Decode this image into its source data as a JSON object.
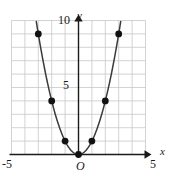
{
  "figure": {
    "name": "coordinate-plane-parabola",
    "width": 172,
    "height": 181
  },
  "labels": {
    "y_max": "10",
    "y_mid": "5",
    "y_axis_name": "y",
    "x_min": "-5",
    "x_max": "5",
    "x_axis_name": "x",
    "origin": "O"
  },
  "colors": {
    "grid": "#c9c6c9",
    "axis": "#1b1b1b",
    "curve": "#3a3a3a",
    "point": "#111111",
    "background": "#ffffff"
  },
  "chart_data": {
    "type": "scatter",
    "title": "",
    "xlabel": "x",
    "ylabel": "y",
    "xlim": [
      -5,
      5
    ],
    "ylim": [
      0,
      10
    ],
    "xticks": [
      -5,
      5
    ],
    "yticks": [
      5,
      10
    ],
    "grid": true,
    "grid_step": 1,
    "legend": "none",
    "curve": {
      "name": "y = x^2",
      "equation": "y = x^2",
      "style": "solid"
    },
    "x": [
      -3,
      -2,
      -1,
      0,
      1,
      2,
      3
    ],
    "values": [
      9,
      4,
      1,
      0,
      1,
      4,
      9
    ],
    "points": [
      {
        "x": -3,
        "y": 9
      },
      {
        "x": -2,
        "y": 4
      },
      {
        "x": -1,
        "y": 1
      },
      {
        "x": 0,
        "y": 0
      },
      {
        "x": 1,
        "y": 1
      },
      {
        "x": 2,
        "y": 4
      },
      {
        "x": 3,
        "y": 9
      }
    ],
    "annotations": [
      {
        "text": "O",
        "x": 0,
        "y": 0,
        "role": "origin-marker"
      }
    ]
  }
}
